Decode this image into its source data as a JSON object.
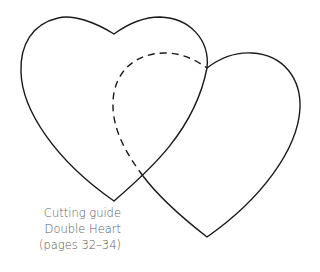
{
  "caption": {
    "line1": "Cutting guide",
    "line2": "Double Heart",
    "line3": "(pages 32–34)"
  },
  "colors": {
    "outline": "#1a1a1a",
    "caption": "#5a5a5a",
    "background": "#ffffff"
  },
  "shapes": [
    {
      "name": "left-heart",
      "style": "solid"
    },
    {
      "name": "right-heart",
      "style": "solid"
    },
    {
      "name": "hidden-outline-right-heart",
      "style": "dashed"
    }
  ]
}
